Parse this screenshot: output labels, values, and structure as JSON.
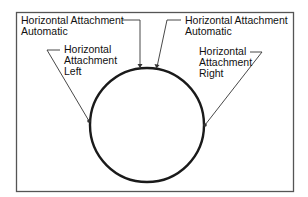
{
  "diagram": {
    "colors": {
      "frame": "#555555",
      "circle": "#1a1a1a",
      "leader": "#333333",
      "text": "#111111",
      "background": "#ffffff"
    },
    "labels": [
      {
        "id": "auto-left",
        "line1": "Horizontal Attachment",
        "line2": "Automatic"
      },
      {
        "id": "auto-right",
        "line1": "Horizontal Attachment",
        "line2": "Automatic"
      },
      {
        "id": "left",
        "line1": "Horizontal",
        "line2": "Attachment",
        "line3": "Left"
      },
      {
        "id": "right",
        "line1": "Horizontal",
        "line2": "Attachment",
        "line3": "Right"
      }
    ]
  }
}
